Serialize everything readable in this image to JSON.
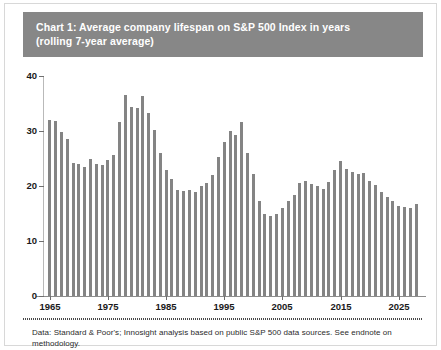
{
  "figure": {
    "title_line_1": "Chart 1: Average company lifespan on S&P 500 Index in years",
    "title_line_2": "(rolling 7-year average)",
    "footer_note": "Data: Standard & Poor's; Innosight analysis based on public S&P 500 data sources. See endnote on methodology.",
    "title_band_color": "#878787",
    "bar_color": "#848484",
    "background_color": "#ffffff",
    "frame_color": "#d8d8d8"
  },
  "chart_data": {
    "type": "bar",
    "title": "Chart 1: Average company lifespan on S&P 500 Index in years (rolling 7-year average)",
    "xlabel": "",
    "ylabel": "",
    "ylim": [
      0,
      40
    ],
    "xlim": [
      1964,
      2029
    ],
    "grid": false,
    "legend": "none",
    "ytick_labels": [
      "0",
      "10",
      "20",
      "30",
      "40"
    ],
    "ytick_values": [
      0,
      10,
      20,
      30,
      40
    ],
    "xtick_labels": [
      "1965",
      "1975",
      "1985",
      "1995",
      "2005",
      "2015",
      "2025"
    ],
    "xtick_values": [
      1965,
      1975,
      1985,
      1995,
      2005,
      2015,
      2025
    ],
    "categories": [
      1965,
      1966,
      1967,
      1968,
      1969,
      1970,
      1971,
      1972,
      1973,
      1974,
      1975,
      1976,
      1977,
      1978,
      1979,
      1980,
      1981,
      1982,
      1983,
      1984,
      1985,
      1986,
      1987,
      1988,
      1989,
      1990,
      1991,
      1992,
      1993,
      1994,
      1995,
      1996,
      1997,
      1998,
      1999,
      2000,
      2001,
      2002,
      2003,
      2004,
      2005,
      2006,
      2007,
      2008,
      2009,
      2010,
      2011,
      2012,
      2013,
      2014,
      2015,
      2016,
      2017,
      2018,
      2019,
      2020,
      2021,
      2022,
      2023,
      2024,
      2025,
      2026,
      2027,
      2028
    ],
    "values": [
      32.0,
      31.8,
      29.9,
      28.6,
      24.2,
      24.0,
      23.5,
      25.0,
      24.0,
      23.8,
      24.8,
      25.7,
      31.6,
      36.5,
      34.3,
      34.2,
      36.3,
      33.3,
      30.2,
      26.0,
      23.0,
      21.2,
      19.3,
      19.1,
      19.2,
      19.0,
      20.0,
      20.5,
      22.0,
      25.3,
      28.0,
      30.0,
      29.3,
      31.6,
      26.0,
      22.2,
      17.2,
      15.0,
      14.5,
      15.0,
      16.0,
      17.2,
      18.3,
      20.6,
      21.0,
      20.3,
      20.0,
      19.5,
      20.7,
      23.0,
      24.5,
      23.1,
      22.5,
      22.1,
      22.4,
      21.0,
      20.1,
      19.0,
      18.0,
      17.2,
      16.3,
      16.1,
      16.0,
      16.7
    ],
    "annotations": {
      "peak_year": 1978,
      "peak_value": 36.5,
      "trough_year": 2003,
      "trough_value": 14.5
    }
  }
}
